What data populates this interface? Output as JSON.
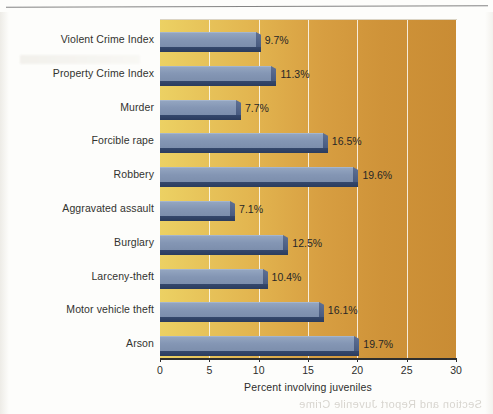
{
  "chart_data": {
    "type": "bar",
    "orientation": "horizontal",
    "title": "",
    "xlabel": "Percent involving juveniles",
    "ylabel": "",
    "xlim": [
      0,
      30
    ],
    "xticks": [
      0,
      5,
      10,
      15,
      20,
      25,
      30
    ],
    "xtick_labels": [
      "0",
      "5",
      "10",
      "15",
      "20",
      "25",
      "30"
    ],
    "grid": true,
    "grid_axis": "x",
    "legend": "none",
    "categories": [
      "Violent Crime Index",
      "Property Crime Index",
      "Murder",
      "Forcible rape",
      "Robbery",
      "Aggravated assault",
      "Burglary",
      "Larceny-theft",
      "Motor vehicle theft",
      "Arson"
    ],
    "values": [
      9.7,
      11.3,
      7.7,
      16.5,
      19.6,
      7.1,
      12.5,
      10.4,
      16.1,
      19.7
    ],
    "value_labels": [
      "9.7%",
      "11.3%",
      "7.7%",
      "16.5%",
      "19.6%",
      "7.1%",
      "12.5%",
      "10.4%",
      "16.1%",
      "19.7%"
    ],
    "bars": [
      {
        "category": "Violent Crime Index",
        "value": 9.7,
        "label": "9.7%"
      },
      {
        "category": "Property Crime Index",
        "value": 11.3,
        "label": "11.3%"
      },
      {
        "category": "Murder",
        "value": 7.7,
        "label": "7.7%"
      },
      {
        "category": "Forcible rape",
        "value": 16.5,
        "label": "16.5%"
      },
      {
        "category": "Robbery",
        "value": 19.6,
        "label": "19.6%"
      },
      {
        "category": "Aggravated assault",
        "value": 7.1,
        "label": "7.1%"
      },
      {
        "category": "Burglary",
        "value": 12.5,
        "label": "12.5%"
      },
      {
        "category": "Larceny-theft",
        "value": 10.4,
        "label": "10.4%"
      },
      {
        "category": "Motor vehicle theft",
        "value": 16.1,
        "label": "16.1%"
      },
      {
        "category": "Arson",
        "value": 19.7,
        "label": "19.7%"
      }
    ],
    "colors": {
      "bar_face": "#8496b4",
      "bar_shadow": "#2f4166",
      "plot_background_left": "#ecd163",
      "plot_background_right": "#c98c34",
      "gridline": "#fffffc",
      "axis": "#2f2f2f",
      "text": "#2d2d2b",
      "page_background": "#fdfdfb"
    }
  }
}
